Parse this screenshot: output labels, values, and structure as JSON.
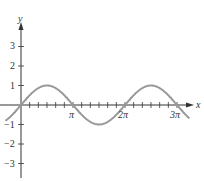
{
  "chart_data": {
    "type": "line",
    "title": "",
    "xlabel": "x",
    "ylabel": "y",
    "function": "y = 0.5 sin x",
    "x_ticks": [
      "π",
      "2π",
      "3π"
    ],
    "y_ticks": [
      "3",
      "2",
      "1",
      "-1",
      "-2",
      "-3"
    ],
    "xlim": [
      -0.6,
      3.3
    ],
    "ylim": [
      -3.7,
      4
    ],
    "series": [
      {
        "name": "curve",
        "x": [
          0,
          0.5,
          1,
          1.5,
          2,
          2.5,
          3
        ],
        "y": [
          0,
          0.5,
          0,
          -0.5,
          0,
          0.5,
          0
        ],
        "x_unit": "π"
      }
    ],
    "grid": false,
    "colors": {
      "curve": "#999999",
      "axes": "#333333"
    }
  },
  "labels": {
    "x": "x",
    "y": "y",
    "pi": "π",
    "twopi": "2π",
    "threepi": "3π",
    "y3": "3",
    "y2": "2",
    "y1": "1",
    "ym1": "−1",
    "ym2": "−2",
    "ym3": "−3"
  }
}
